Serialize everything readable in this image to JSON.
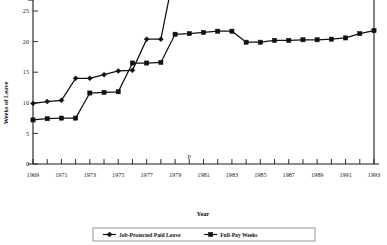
{
  "chart_data": {
    "type": "line",
    "title": "",
    "xlabel": "Year",
    "ylabel": "Weeks of Leave",
    "xlim": [
      1969,
      1993
    ],
    "ylim": [
      0,
      33
    ],
    "ytick_values": [
      0,
      5,
      10,
      15,
      20,
      25,
      30
    ],
    "ytick_labels": [
      "0",
      "5",
      "10",
      "15",
      "20",
      "25",
      "30"
    ],
    "xtick_labels": [
      "1969",
      "1971",
      "1973",
      "1975",
      "1977",
      "1979",
      "1981",
      "1983",
      "1985",
      "1987",
      "1989",
      "1991",
      "1993"
    ],
    "xtick_values": [
      1969,
      1971,
      1973,
      1975,
      1977,
      1979,
      1981,
      1983,
      1985,
      1987,
      1989,
      1991,
      1993
    ],
    "grid": false,
    "legend_position": "bottom",
    "x": [
      1969,
      1970,
      1971,
      1972,
      1973,
      1974,
      1975,
      1976,
      1977,
      1978,
      1979,
      1980,
      1981,
      1982,
      1983,
      1984,
      1985,
      1986,
      1987,
      1988,
      1989,
      1990,
      1991,
      1992,
      1993
    ],
    "series": [
      {
        "name": "Job-Protected Paid Leave",
        "marker": "diamond",
        "values": [
          9.9,
          10.2,
          10.4,
          14.0,
          14.0,
          14.6,
          15.2,
          15.3,
          20.4,
          20.4,
          32.0,
          32.0,
          32.6,
          32.8,
          31.1,
          30.9,
          31.0,
          31.0,
          31.0,
          31.0,
          31.0,
          31.0,
          31.1,
          32.2,
          32.9
        ]
      },
      {
        "name": "Full-Pay Weeks",
        "marker": "square",
        "values": [
          7.2,
          7.4,
          7.5,
          7.5,
          11.6,
          11.7,
          11.8,
          16.5,
          16.5,
          16.6,
          21.2,
          21.3,
          21.5,
          21.7,
          21.7,
          19.9,
          19.9,
          20.2,
          20.2,
          20.3,
          20.3,
          20.4,
          20.6,
          21.3,
          21.8
        ]
      }
    ],
    "annotations": [
      {
        "text": "p",
        "x": 1980,
        "note": "stray glyph above x-axis"
      }
    ]
  },
  "colors": {
    "ink": "#111111",
    "background": "#ffffff",
    "axis": "#1a1a1a"
  },
  "legend": {
    "entries": [
      {
        "label": "Job-Protected Paid Leave",
        "marker": "diamond"
      },
      {
        "label": "Full-Pay Weeks",
        "marker": "square"
      }
    ]
  }
}
